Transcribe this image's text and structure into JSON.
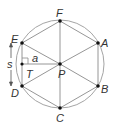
{
  "diagram": {
    "colors": {
      "line": "#8a8a8a",
      "point": "#111111",
      "text": "#333333"
    },
    "circle": {
      "cx": 60,
      "cy": 64,
      "r": 44
    },
    "center": {
      "label": "P",
      "x": 60,
      "y": 64
    },
    "vertices": [
      {
        "label": "F",
        "x": 60,
        "y": 21
      },
      {
        "label": "A",
        "x": 98,
        "y": 43
      },
      {
        "label": "B",
        "x": 98,
        "y": 86
      },
      {
        "label": "C",
        "x": 60,
        "y": 108
      },
      {
        "label": "D",
        "x": 22,
        "y": 86
      },
      {
        "label": "E",
        "x": 22,
        "y": 43
      }
    ],
    "apothem": {
      "label": "a",
      "foot": {
        "x": 22,
        "y": 64
      }
    },
    "side": {
      "label": "s"
    },
    "triangle": {
      "label": "T"
    }
  }
}
